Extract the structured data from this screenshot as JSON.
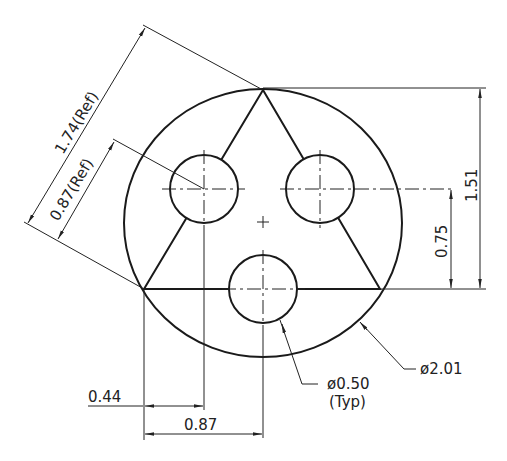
{
  "drawing": {
    "title": "Triangular hole pattern on circular part",
    "dimensions": {
      "overall_slant": "1.74(Ref)",
      "half_slant": "0.87(Ref)",
      "height_total": "1.51",
      "height_half": "0.75",
      "horiz_small": "0.44",
      "horiz_large": "0.87",
      "hole_dia": "ø0.50",
      "hole_note": "(Typ)",
      "outer_dia": "ø2.01"
    }
  }
}
